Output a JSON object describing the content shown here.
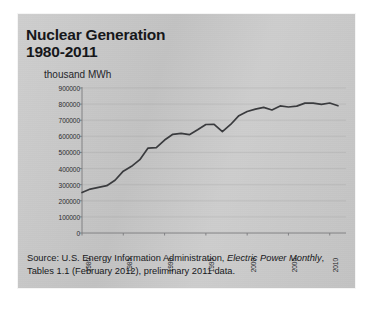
{
  "figure": {
    "title_line1": "Nuclear Generation",
    "title_line2": "1980-2011",
    "unit_label": "thousand MWh",
    "source_prefix": "Source: U.S. Energy Information Administration, ",
    "source_italic1": "Electric Power Monthly",
    "source_suffix": ", Tables 1.1 (February 2012), preliminary  2011 data.",
    "panel_color": "#c9c9c9",
    "line_color": "#3a3b3e",
    "axis_color": "#7a7b7e",
    "text_color": "#17181b"
  },
  "chart_data": {
    "type": "line",
    "title": "Nuclear Generation 1980-2011",
    "xlabel": "",
    "ylabel": "thousand MWh",
    "ylim": [
      0,
      900000
    ],
    "xlim": [
      1980,
      2011
    ],
    "grid": true,
    "legend": "none",
    "ytick_labels": [
      "900000",
      "800000",
      "700000",
      "600000",
      "500000",
      "400000",
      "300000",
      "200000",
      "100000",
      "0"
    ],
    "ytick_values": [
      900000,
      800000,
      700000,
      600000,
      500000,
      400000,
      300000,
      200000,
      100000,
      0
    ],
    "xtick_labels": [
      "1980",
      "1985",
      "1990",
      "1995",
      "2000",
      "2005",
      "2010"
    ],
    "xtick_values": [
      1980,
      1985,
      1990,
      1995,
      2000,
      2005,
      2010
    ],
    "x": [
      1980,
      1981,
      1982,
      1983,
      1984,
      1985,
      1986,
      1987,
      1988,
      1989,
      1990,
      1991,
      1992,
      1993,
      1994,
      1995,
      1996,
      1997,
      1998,
      1999,
      2000,
      2001,
      2002,
      2003,
      2004,
      2005,
      2006,
      2007,
      2008,
      2009,
      2010,
      2011
    ],
    "series": [
      {
        "name": "Nuclear Generation",
        "values": [
          251116,
          272674,
          282773,
          293677,
          327634,
          383691,
          414038,
          455270,
          526973,
          529355,
          576862,
          612565,
          618776,
          610291,
          640440,
          673402,
          674729,
          628644,
          673702,
          728254,
          753893,
          768826,
          780064,
          763733,
          788528,
          781986,
          787219,
          806425,
          806208,
          798855,
          806968,
          790204
        ]
      }
    ]
  }
}
